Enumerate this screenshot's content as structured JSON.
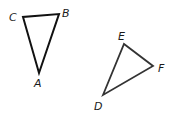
{
  "diagram": {
    "triangles": [
      {
        "name": "triangle-ABC",
        "stroke": "#111111",
        "vertices": [
          {
            "label": "A",
            "x": 39,
            "y": 73
          },
          {
            "label": "B",
            "x": 59,
            "y": 14
          },
          {
            "label": "C",
            "x": 23,
            "y": 17
          }
        ]
      },
      {
        "name": "triangle-DEF",
        "stroke": "#333333",
        "vertices": [
          {
            "label": "D",
            "x": 103,
            "y": 95
          },
          {
            "label": "E",
            "x": 124,
            "y": 44
          },
          {
            "label": "F",
            "x": 153,
            "y": 66
          }
        ]
      }
    ],
    "labels": {
      "A": "A",
      "B": "B",
      "C": "C",
      "D": "D",
      "E": "E",
      "F": "F"
    }
  }
}
